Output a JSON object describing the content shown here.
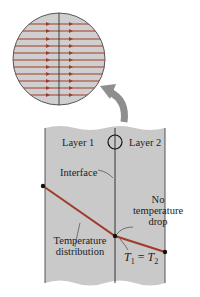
{
  "figure": {
    "labels": {
      "layer1": "Layer 1",
      "layer2": "Layer 2",
      "interface": "Interface",
      "no_drop_line1": "No",
      "no_drop_line2": "temperature",
      "no_drop_line3": "drop",
      "temp_dist_line1": "Temperature",
      "temp_dist_line2": "distribution",
      "equation_t1": "T",
      "equation_sub1": "1",
      "equation_eq": " = ",
      "equation_t2": "T",
      "equation_sub2": "2"
    },
    "colors": {
      "slab": "#c9c9c9",
      "line": "#a23a2a",
      "border": "#222222",
      "arrow": "#8e8e8e"
    },
    "magnified_view": {
      "flow_lines": 11,
      "direction": "left-to-right"
    }
  }
}
